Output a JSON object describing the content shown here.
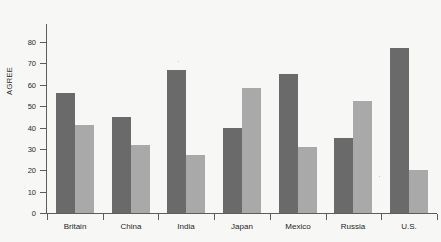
{
  "page": {
    "background_color": "#f7f7f5",
    "bleed_through_text": "",
    "axis_color": "#5d5d5d",
    "text_color": "#1f1f1f"
  },
  "chart_data": {
    "type": "bar",
    "title": "",
    "subtitle": "",
    "xlabel": "",
    "ylabel": "AGREE",
    "ylim": [
      0,
      80
    ],
    "ytick_values": [
      0,
      10,
      20,
      30,
      40,
      50,
      60,
      70,
      80
    ],
    "ytick_labels": [
      "0",
      "10",
      "20",
      "30",
      "40",
      "50",
      "60",
      "70",
      "80"
    ],
    "grid": false,
    "legend": false,
    "legend_position": "none",
    "categories": [
      "Britain",
      "China",
      "India",
      "Japan",
      "Mexico",
      "Russia",
      "U.S."
    ],
    "series": [
      {
        "name": "series-1",
        "color": "#6a6a6a",
        "values": [
          56,
          45,
          67,
          40,
          65,
          35,
          77
        ]
      },
      {
        "name": "series-2",
        "color": "#a9a9a9",
        "values": [
          41,
          32,
          27,
          58.5,
          31,
          52.5,
          20
        ]
      }
    ]
  }
}
